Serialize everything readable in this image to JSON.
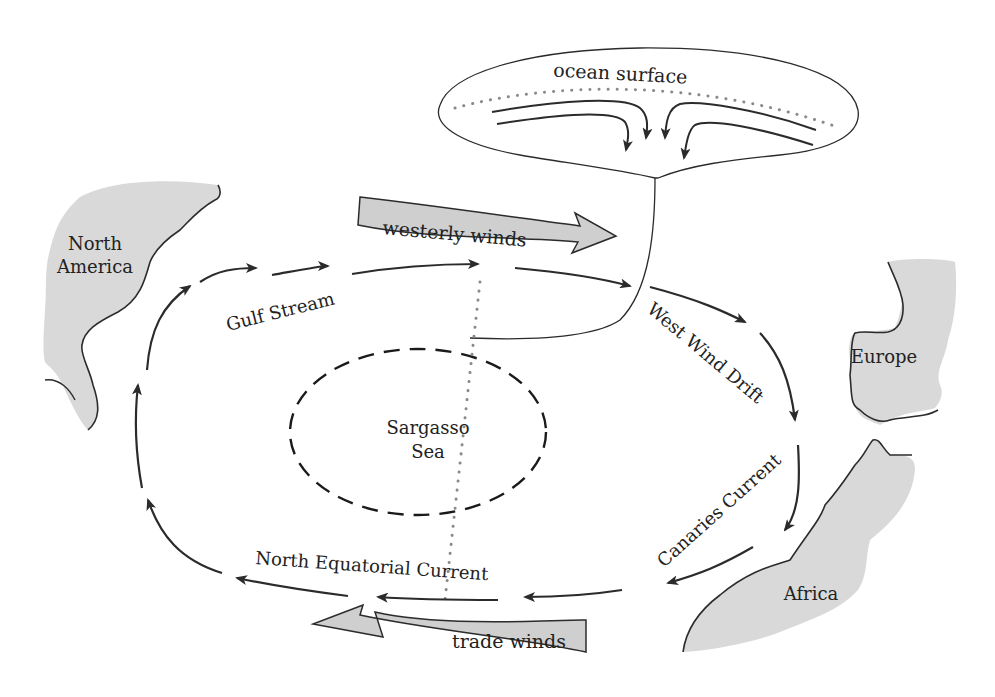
{
  "diagram": {
    "type": "North Atlantic gyre circulation diagram",
    "inset": {
      "label": "ocean surface"
    },
    "landmasses": [
      {
        "id": "north-america",
        "label_lines": [
          "North",
          "America"
        ]
      },
      {
        "id": "europe",
        "label": "Europe"
      },
      {
        "id": "africa",
        "label": "Africa"
      }
    ],
    "winds": [
      {
        "id": "westerlies",
        "label": "westerly winds",
        "direction": "east"
      },
      {
        "id": "trades",
        "label": "trade winds",
        "direction": "west"
      }
    ],
    "currents": [
      {
        "id": "gulf-stream",
        "label": "Gulf Stream"
      },
      {
        "id": "west-wind-drift",
        "label": "West Wind Drift"
      },
      {
        "id": "canaries-current",
        "label": "Canaries Current"
      },
      {
        "id": "north-equatorial-current",
        "label": "North Equatorial Current"
      }
    ],
    "center": {
      "label_lines": [
        "Sargasso",
        "Sea"
      ]
    },
    "colors": {
      "land": "#d9d9d9",
      "line": "#2b2b2b",
      "wind_fill": "#cfcfcf",
      "dots": "#8a8a8a"
    }
  }
}
